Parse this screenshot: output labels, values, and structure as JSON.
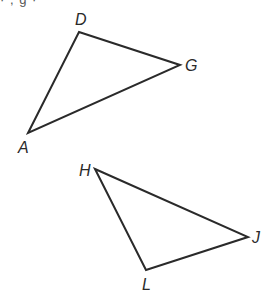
{
  "header_fragment": "·                    ,     g              ·",
  "triangles": [
    {
      "name": "DGA",
      "vertices": [
        {
          "label": "D",
          "x": 79,
          "y": 32,
          "lx": 75,
          "ly": 25
        },
        {
          "label": "G",
          "x": 180,
          "y": 65,
          "lx": 185,
          "ly": 71
        },
        {
          "label": "A",
          "x": 28,
          "y": 133,
          "lx": 18,
          "ly": 153
        }
      ]
    },
    {
      "name": "HJL",
      "vertices": [
        {
          "label": "H",
          "x": 95,
          "y": 169,
          "lx": 79,
          "ly": 176
        },
        {
          "label": "J",
          "x": 248,
          "y": 237,
          "lx": 252,
          "ly": 243
        },
        {
          "label": "L",
          "x": 146,
          "y": 270,
          "lx": 142,
          "ly": 290
        }
      ]
    }
  ],
  "colors": {
    "stroke": "#2a2a2a",
    "background": "#ffffff"
  }
}
